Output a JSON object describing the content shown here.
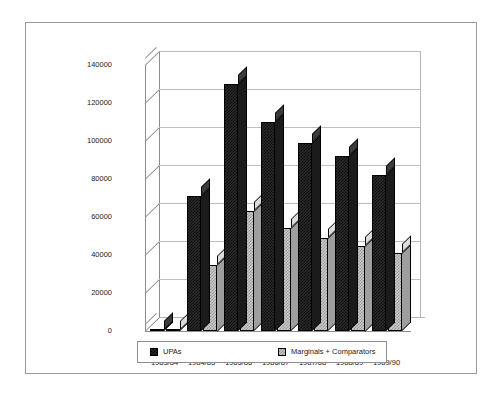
{
  "chart_data": {
    "type": "bar",
    "title": "",
    "subtitle": "",
    "xlabel": "",
    "ylabel": "",
    "categories": [
      "1983/84",
      "1984/85",
      "1985/86",
      "1986/87",
      "1987/88",
      "1988/89",
      "1989/90"
    ],
    "series": [
      {
        "name": "UPAs",
        "color": "#2b2b2b",
        "values": [
          0,
          71000,
          130000,
          110000,
          99000,
          92000,
          82000
        ]
      },
      {
        "name": "Marginals + Comparators",
        "color": "#c9c9c9",
        "values": [
          0,
          35000,
          63000,
          54000,
          49000,
          45000,
          41000
        ]
      }
    ],
    "ylim": [
      0,
      140000
    ],
    "ytick_values": [
      140000,
      120000,
      100000,
      80000,
      60000,
      40000,
      20000,
      0
    ],
    "ytick_labels": [
      "140000",
      "120000",
      "100000",
      "80000",
      "60000",
      "40000",
      "20000",
      "0"
    ],
    "grid": true,
    "legend_position": "bottom",
    "style": "3d-column"
  },
  "legend": {
    "entries": [
      {
        "label": "UPAs",
        "swatch": "dark-swatch"
      },
      {
        "label": "Marginals + Comparators",
        "swatch": "light-swatch"
      }
    ]
  }
}
